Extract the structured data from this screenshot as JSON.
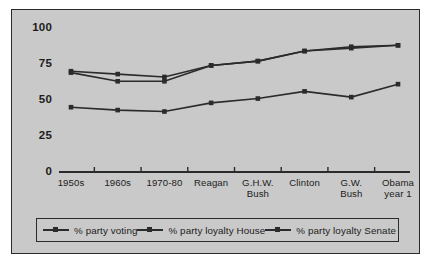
{
  "figure": {
    "background_color": "#c9c9c9",
    "border_color": "#2b2b2b",
    "line_color": "#2b2b2b",
    "page_background": "#ffffff"
  },
  "chart_data": {
    "type": "line",
    "title": "",
    "subtitle": "",
    "xlabel": "",
    "ylabel": "",
    "ylim": [
      0,
      100
    ],
    "yticks": [
      0,
      25,
      50,
      75,
      100
    ],
    "ytick_labels": [
      "0",
      "25",
      "50",
      "75",
      "100"
    ],
    "grid": false,
    "legend_position": "bottom",
    "categories": [
      "1950s",
      "1960s",
      "1970-80",
      "Reagan",
      "G.H.W.\nBush",
      "Clinton",
      "G.W.\nBush",
      "Obama\nyear 1"
    ],
    "series": [
      {
        "name": "% party voting",
        "marker": "square",
        "color": "#2b2b2b",
        "values": [
          70,
          68,
          66,
          74,
          77,
          84,
          87,
          88
        ]
      },
      {
        "name": "% party loyalty House",
        "marker": "square",
        "color": "#2b2b2b",
        "values": [
          69,
          63,
          63,
          74,
          77,
          84,
          86,
          88
        ]
      },
      {
        "name": "% party loyalty Senate",
        "marker": "square",
        "color": "#2b2b2b",
        "values": [
          45,
          43,
          42,
          48,
          51,
          56,
          52,
          61
        ]
      }
    ]
  },
  "legend": {
    "items": [
      {
        "label": "% party voting"
      },
      {
        "label": "% party loyalty House"
      },
      {
        "label": "% party loyalty Senate"
      }
    ]
  }
}
